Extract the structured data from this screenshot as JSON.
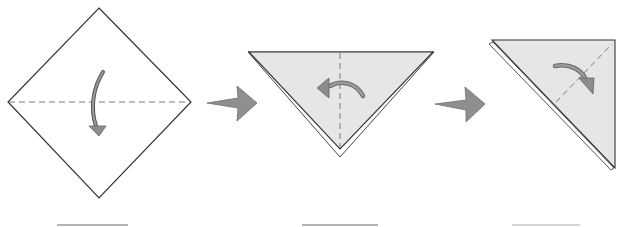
{
  "diagram": {
    "type": "origami-folding-steps",
    "colors": {
      "paper_front": "#ffffff",
      "paper_back": "#e6e6e6",
      "outline": "#333333",
      "fold_line": "#777777",
      "arrow_fill": "#8c8c8c",
      "step_arrow_fill": "#8f8f8f",
      "underline": "#9a9a9a"
    },
    "steps": [
      {
        "id": 1,
        "shape": "square-diamond",
        "fold": "valley fold in half downward along horizontal diagonal",
        "fold_line": "horizontal dashed",
        "arrow": "curved-arrow-down",
        "label": ""
      },
      {
        "id": 2,
        "shape": "triangle-point-down",
        "fold": "valley fold in half to the left along vertical center",
        "fold_line": "vertical dashed",
        "arrow": "curved-arrow-left",
        "label": ""
      },
      {
        "id": 3,
        "shape": "right-triangle",
        "fold": "fold top-right corner down along diagonal",
        "fold_line": "diagonal dashed",
        "arrow": "curved-arrow-down-right",
        "label": ""
      }
    ],
    "transitions": [
      {
        "from": 1,
        "to": 2,
        "icon": "step-arrow-right"
      },
      {
        "from": 2,
        "to": 3,
        "icon": "step-arrow-right"
      }
    ]
  }
}
